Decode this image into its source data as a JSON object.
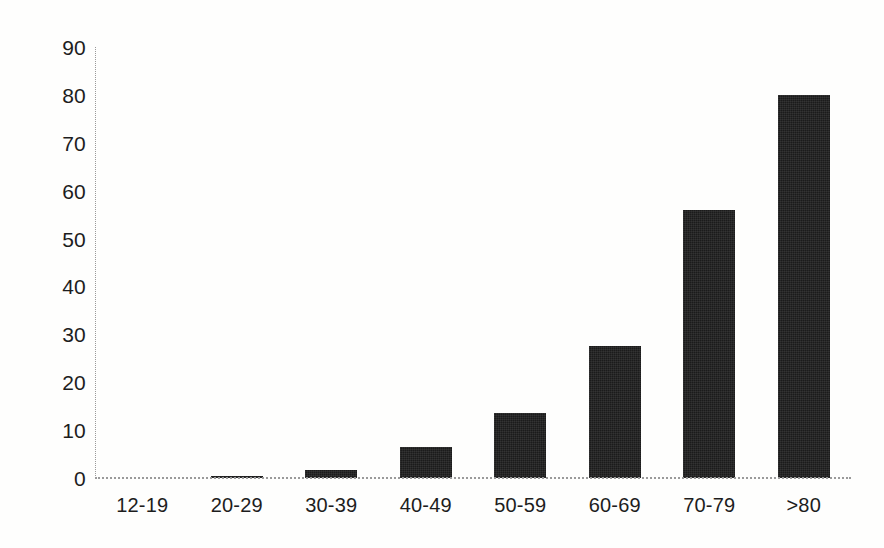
{
  "chart_data": {
    "type": "bar",
    "title": "",
    "subtitle": "",
    "xlabel": "",
    "ylabel": "",
    "categories": [
      "12-19",
      "20-29",
      "30-39",
      "40-49",
      "50-59",
      "60-69",
      "70-79",
      ">80"
    ],
    "values": [
      0,
      0.5,
      1.7,
      6.5,
      13.5,
      27.5,
      56,
      80
    ],
    "series": [
      {
        "name": "",
        "values": [
          0,
          0.5,
          1.7,
          6.5,
          13.5,
          27.5,
          56,
          80
        ]
      }
    ],
    "ylim": [
      0,
      90
    ],
    "yticks": [
      0,
      10,
      20,
      30,
      40,
      50,
      60,
      70,
      80,
      90
    ],
    "ytick_labels": [
      "0",
      "10",
      "20",
      "30",
      "40",
      "50",
      "60",
      "70",
      "80",
      "90"
    ],
    "xtick_labels": [
      "12-19",
      "20-29",
      "30-39",
      "40-49",
      "50-59",
      "60-69",
      "70-79",
      ">80"
    ],
    "grid": false,
    "legend": false,
    "legend_position": "none",
    "annotations": [],
    "bar_color": "#1b1b1b",
    "axis_color": "#9a9a9a",
    "background_color": "#fefefd",
    "text_color": "#1d1d1d"
  }
}
